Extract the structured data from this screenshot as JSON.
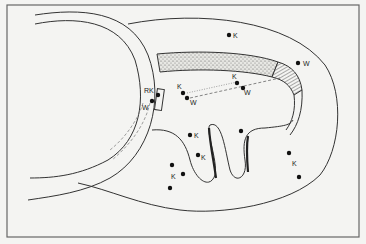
{
  "figure": {
    "background": "#f4f4f2",
    "frame_color": "#666666",
    "line_color": "#333333",
    "dot_color": "#111111",
    "labels": {
      "rk": "RK",
      "w1": "W",
      "k_a": "K",
      "w_a": "W",
      "k_b": "K",
      "w_b": "W",
      "k_top": "K",
      "w_top": "W",
      "k_c": "K",
      "k_d": "K",
      "k_e": "K",
      "k_f": "K"
    }
  }
}
